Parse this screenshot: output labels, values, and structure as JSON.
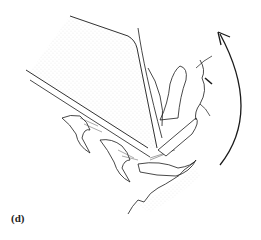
{
  "figure": {
    "panel_label": "(d)",
    "elements": {
      "substrate_block": "stippled block",
      "claws": "curved hooked claws",
      "rough_surface": "irregular rock/bark edge",
      "rotation_arrow": "counter-clockwise curved arrow pointing up"
    },
    "colors": {
      "line": "#1a1a1a",
      "stipple": "#9a9a9a",
      "background": "#ffffff"
    }
  }
}
